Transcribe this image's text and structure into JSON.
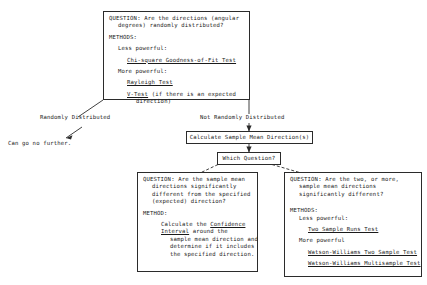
{
  "diagram": {
    "ink_color": "#2b2b2b",
    "background": "#ffffff"
  },
  "top_box": {
    "question_l1": "QUESTION: Are the directions (angular",
    "question_l2": "degrees) randomly distributed?",
    "methods_label": "METHODS:",
    "less_powerful_label": "Less powerful:",
    "less_powerful_test": "Chi-square Goodness-of-Fit Test",
    "more_powerful_label": "More powerful:",
    "more_powerful_test_1": "Rayleigh Test",
    "more_powerful_test_2": "V-Test",
    "more_powerful_test_2_note": " (if there is an expected",
    "more_powerful_test_2_note2": "direction)"
  },
  "branch_labels": {
    "left": "Randomly Distributed",
    "right": "Not Randomly Distributed",
    "terminal": "Can go no further."
  },
  "mid_boxes": {
    "calculate": "Calculate Sample Mean Direction(s)",
    "which_question": "Which Question?"
  },
  "left_box": {
    "question_l1": "QUESTION: Are the sample mean",
    "question_l2": "directions significantly",
    "question_l3": "different from the specified",
    "question_l4": "(expected) direction?",
    "method_label": "METHOD:",
    "body_l1_pre": "Calculate the ",
    "body_l1_link": "Confidence",
    "body_l2_link": "Interval",
    "body_l2_post": " around the",
    "body_l3": "sample mean direction and",
    "body_l4": "determine if it includes",
    "body_l5": "the specified direction."
  },
  "right_box": {
    "question_l1": "QUESTION: Are the two, or more,",
    "question_l2": "sample mean directions",
    "question_l3": "significantly different?",
    "methods_label": "METHODS:",
    "less_powerful_label": "Less powerful:",
    "less_powerful_test": "Two Sample Runs Test",
    "more_powerful_label": "More powerful",
    "more_powerful_test_1": "Watson-Williams Two Sample Test",
    "more_powerful_test_2": "Watson-Williams Multisample Test"
  }
}
